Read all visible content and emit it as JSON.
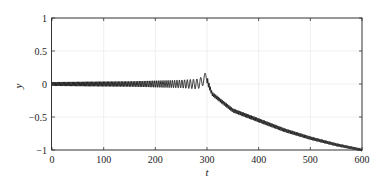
{
  "chart_data": {
    "type": "line",
    "title": "",
    "xlabel": "t",
    "ylabel": "y",
    "xlim": [
      0,
      600
    ],
    "ylim": [
      -1,
      1
    ],
    "xticks": [
      0,
      100,
      200,
      300,
      400,
      500,
      600
    ],
    "xtick_labels": [
      "0",
      "100",
      "200",
      "300",
      "400",
      "500",
      "600"
    ],
    "yticks": [
      1,
      0.5,
      0,
      -0.5,
      -1
    ],
    "ytick_labels": [
      "1",
      "0.5",
      "0",
      "−0.5",
      "−1"
    ],
    "grid": true,
    "legend": null,
    "series": [
      {
        "name": "y(t)",
        "color": "#000000",
        "description": "Small fast oscillation around 0 whose amplitude grows and frequency drops toward t≈300; peaks at ~0.12 near t≈295, then drops and decays smoothly (with small oscillations) toward -1 at t=600",
        "envelope_center": {
          "t": [
            0,
            100,
            200,
            280,
            300,
            310,
            350,
            400,
            450,
            500,
            550,
            600
          ],
          "y": [
            0,
            0,
            0,
            0,
            0.05,
            -0.15,
            -0.4,
            -0.55,
            -0.7,
            -0.82,
            -0.92,
            -1.0
          ]
        },
        "oscillation_amplitude": {
          "t": [
            0,
            150,
            250,
            290,
            310,
            400,
            600
          ],
          "a": [
            0.03,
            0.04,
            0.06,
            0.08,
            0.03,
            0.03,
            0.02
          ]
        },
        "peak": {
          "t": 296,
          "y": 0.12
        }
      }
    ]
  },
  "frame": {
    "color": "#333333",
    "grid_color": "#e6e6e6"
  }
}
